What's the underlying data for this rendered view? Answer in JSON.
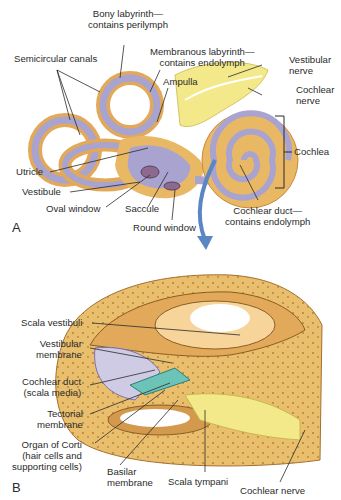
{
  "panel_a": {
    "letter": "A",
    "labels": {
      "bony_labyrinth": [
        "Bony labyrinth—",
        "contains perilymph"
      ],
      "semicircular_canals": "Semicircular canals",
      "membranous_labyrinth": [
        "Membranous labyrinth—",
        "contains endolymph"
      ],
      "ampulla": "Ampulla",
      "vestibular_nerve": [
        "Vestibular",
        "nerve"
      ],
      "cochlear_nerve": [
        "Cochlear",
        "nerve"
      ],
      "cochlea": "Cochlea",
      "utricle": "Utricle",
      "vestibule": "Vestibule",
      "oval_window": "Oval window",
      "saccule": "Saccule",
      "round_window": "Round window",
      "cochlear_duct": [
        "Cochlear duct—",
        "contains endolymph"
      ]
    }
  },
  "panel_b": {
    "letter": "B",
    "labels": {
      "scala_vestibuli": "Scala vestibuli",
      "vestibular_membrane": [
        "Vestibular",
        "membrane"
      ],
      "cochlear_duct": [
        "Cochlear duct",
        "(scala media)"
      ],
      "tectorial_membrane": [
        "Tectorial",
        "membrane"
      ],
      "organ_of_corti": [
        "Organ of Corti",
        "(hair cells and",
        "supporting cells)"
      ],
      "basilar_membrane": [
        "Basilar",
        "membrane"
      ],
      "scala_tympani": "Scala tympani",
      "cochlear_nerve": "Cochlear nerve"
    }
  },
  "colors": {
    "bone": "#e9b865",
    "bone_dark": "#c98a3a",
    "membranous": "#a9a3cf",
    "nerve": "#f3e98a",
    "arrow": "#5b86c4",
    "duct_teal": "#6cc3b8",
    "text": "#2b2b2b"
  }
}
